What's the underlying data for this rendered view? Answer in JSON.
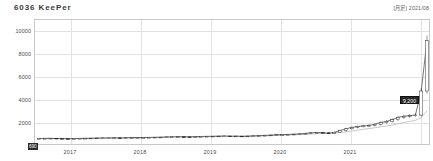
{
  "header": {
    "title": "6036 KeePer",
    "meta": "[月足] 2021/08"
  },
  "chart_data": {
    "type": "line",
    "title": "6036 KeePer",
    "subtitle": "[月足] 2021/08",
    "xlabel": "",
    "ylabel": "",
    "grid": true,
    "legend_position": "none",
    "ylim": [
      0,
      11000
    ],
    "yticks": [
      10000,
      8000,
      6000,
      4000,
      2000
    ],
    "ytick_labels": [
      "10000",
      "8000",
      "6000",
      "4000",
      "2000"
    ],
    "xticks": [
      2017,
      2018,
      2019,
      2020,
      2021
    ],
    "xtick_labels": [
      "2017",
      "2018",
      "2019",
      "2020",
      "2021"
    ],
    "current_price_label": "9,200",
    "open_price_label": "690",
    "x": [
      "2016-01",
      "2016-02",
      "2016-03",
      "2016-04",
      "2016-05",
      "2016-06",
      "2016-07",
      "2016-08",
      "2016-09",
      "2016-10",
      "2016-11",
      "2016-12",
      "2017-01",
      "2017-02",
      "2017-03",
      "2017-04",
      "2017-05",
      "2017-06",
      "2017-07",
      "2017-08",
      "2017-09",
      "2017-10",
      "2017-11",
      "2017-12",
      "2018-01",
      "2018-02",
      "2018-03",
      "2018-04",
      "2018-05",
      "2018-06",
      "2018-07",
      "2018-08",
      "2018-09",
      "2018-10",
      "2018-11",
      "2018-12",
      "2019-01",
      "2019-02",
      "2019-03",
      "2019-04",
      "2019-05",
      "2019-06",
      "2019-07",
      "2019-08",
      "2019-09",
      "2019-10",
      "2019-11",
      "2019-12",
      "2020-01",
      "2020-02",
      "2020-03",
      "2020-04",
      "2020-05",
      "2020-06",
      "2020-07",
      "2020-08",
      "2020-09",
      "2020-10",
      "2020-11",
      "2020-12",
      "2021-01",
      "2021-02",
      "2021-03",
      "2021-04",
      "2021-05",
      "2021-06",
      "2021-07",
      "2021-08"
    ],
    "values": [
      650,
      660,
      670,
      655,
      640,
      630,
      645,
      660,
      670,
      680,
      690,
      700,
      700,
      710,
      705,
      715,
      720,
      730,
      740,
      750,
      760,
      770,
      790,
      800,
      810,
      800,
      795,
      810,
      830,
      840,
      850,
      860,
      870,
      850,
      860,
      840,
      860,
      880,
      900,
      930,
      950,
      980,
      1000,
      1010,
      1030,
      1060,
      1100,
      1150,
      1180,
      1150,
      1100,
      1200,
      1350,
      1500,
      1620,
      1700,
      1750,
      1800,
      1900,
      2050,
      2150,
      2300,
      2500,
      2600,
      2650,
      2700,
      4800,
      9200
    ],
    "series": [
      {
        "name": "株価",
        "values": [
          650,
          660,
          670,
          655,
          640,
          630,
          645,
          660,
          670,
          680,
          690,
          700,
          700,
          710,
          705,
          715,
          720,
          730,
          740,
          750,
          760,
          770,
          790,
          800,
          810,
          800,
          795,
          810,
          830,
          840,
          850,
          860,
          870,
          850,
          860,
          840,
          860,
          880,
          900,
          930,
          950,
          980,
          1000,
          1010,
          1030,
          1060,
          1100,
          1150,
          1180,
          1150,
          1100,
          1200,
          1350,
          1500,
          1620,
          1700,
          1750,
          1800,
          1900,
          2050,
          2150,
          2300,
          2500,
          2600,
          2650,
          2700,
          4800,
          9200
        ]
      },
      {
        "name": "移動平均",
        "values": [
          660,
          662,
          664,
          662,
          658,
          654,
          652,
          655,
          660,
          665,
          672,
          680,
          688,
          694,
          698,
          702,
          708,
          714,
          722,
          730,
          740,
          750,
          762,
          774,
          786,
          792,
          796,
          800,
          808,
          818,
          828,
          838,
          848,
          852,
          856,
          854,
          856,
          862,
          872,
          886,
          902,
          920,
          940,
          956,
          972,
          992,
          1016,
          1048,
          1080,
          1102,
          1112,
          1132,
          1178,
          1238,
          1308,
          1382,
          1452,
          1520,
          1592,
          1672,
          1752,
          1842,
          1944,
          2048,
          2148,
          2242,
          2480,
          3060
        ]
      }
    ]
  }
}
